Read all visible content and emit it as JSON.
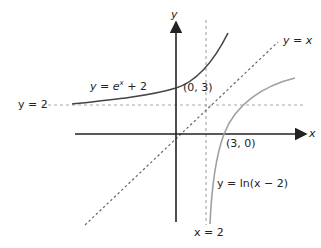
{
  "axes": {
    "x_label": "x",
    "y_label": "y"
  },
  "curves": {
    "exp": {
      "prefix": "y = ",
      "base": "e",
      "exp": "x",
      "suffix": " + 2"
    },
    "ln": {
      "text": "y = ln(x − 2)"
    },
    "identity": {
      "text": "y = x"
    }
  },
  "asymptotes": {
    "horizontal": "y = 2",
    "vertical": "x = 2"
  },
  "points": {
    "exp_intercept": "(0, 3)",
    "ln_intercept": "(3, 0)"
  },
  "colors": {
    "exp": "#444444",
    "ln": "#a0a0a0",
    "axis": "#222222",
    "dashed": "#999999"
  }
}
